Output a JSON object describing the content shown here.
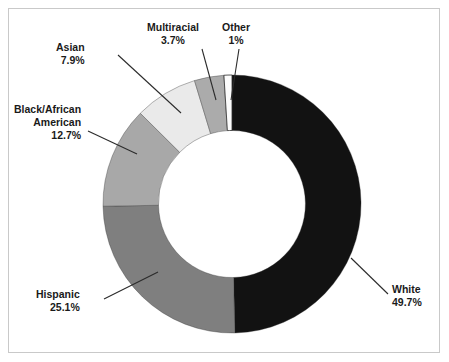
{
  "chart_data": {
    "type": "pie",
    "variant": "donut",
    "title": "",
    "subtitle": "",
    "xlabel": "",
    "ylabel": "",
    "legend": "none",
    "grid": false,
    "labels_shown": "category name and percentage with leader lines",
    "categories": [
      "White",
      "Hispanic",
      "Black/African American",
      "Asian",
      "Multiracial",
      "Other"
    ],
    "values": [
      49.7,
      25.1,
      12.7,
      7.9,
      3.7,
      1.0
    ],
    "value_labels": [
      "49.7%",
      "25.1%",
      "12.7%",
      "7.9%",
      "3.7%",
      "1%"
    ],
    "units": "percent",
    "start_angle_deg": 0,
    "direction": "clockwise",
    "donut_inner_ratio": 0.57,
    "colors": [
      "#121212",
      "#7f7f7f",
      "#a8a8a8",
      "#eaeaea",
      "#ababab",
      "#fcfcfc"
    ],
    "slices": [
      {
        "name": "White",
        "value": 49.7,
        "value_label": "49.7%",
        "color": "#121212"
      },
      {
        "name": "Hispanic",
        "value": 25.1,
        "value_label": "25.1%",
        "color": "#7f7f7f"
      },
      {
        "name": "Black/African American",
        "value": 12.7,
        "value_label": "12.7%",
        "color": "#a8a8a8"
      },
      {
        "name": "Asian",
        "value": 7.9,
        "value_label": "7.9%",
        "color": "#eaeaea"
      },
      {
        "name": "Multiracial",
        "value": 3.7,
        "value_label": "3.7%",
        "color": "#ababab"
      },
      {
        "name": "Other",
        "value": 1.0,
        "value_label": "1%",
        "color": "#fcfcfc"
      }
    ]
  },
  "labels": {
    "white": {
      "name": "White",
      "value": "49.7%"
    },
    "hispanic": {
      "name": "Hispanic",
      "value": "25.1%"
    },
    "black_line1": "Black/African",
    "black_line2": "American",
    "black_value": "12.7%",
    "asian": {
      "name": "Asian",
      "value": "7.9%"
    },
    "multiracial": {
      "name": "Multiracial",
      "value": "3.7%"
    },
    "other": {
      "name": "Other",
      "value": "1%"
    }
  },
  "style": {
    "frame_border_color": "#c9c9c9",
    "background": "#ffffff",
    "leader_line_color": "#2b2b2b",
    "slice_outline_color": "#2b2b2b",
    "text_color": "#1a1a1a"
  }
}
